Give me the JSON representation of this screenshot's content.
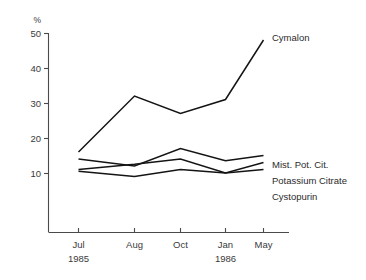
{
  "chart_data": {
    "type": "line",
    "title": "",
    "subtitle": "",
    "xlabel": "",
    "ylabel": "%",
    "ylim": [
      0,
      50
    ],
    "yticks": [
      10,
      20,
      30,
      40,
      50
    ],
    "grid": false,
    "legend_position": "right-inline-labels",
    "categories": [
      "Jul",
      "Aug",
      "Oct",
      "Jan",
      "May"
    ],
    "category_sublabels": [
      "1985",
      "",
      "",
      "1986",
      ""
    ],
    "series": [
      {
        "name": "Cymalon",
        "values": [
          16,
          32,
          27,
          31,
          48
        ]
      },
      {
        "name": "Mist. Pot. Cit.",
        "values": [
          14,
          12,
          17,
          13.5,
          15
        ]
      },
      {
        "name": "Potassium Citrate",
        "values": [
          11,
          12.5,
          14,
          10,
          13
        ]
      },
      {
        "name": "Cystopurin",
        "values": [
          10.5,
          9,
          11,
          10,
          11
        ]
      }
    ],
    "colors": {
      "line": "#141414",
      "axis": "#4a4a4a",
      "text": "#2b2b2b",
      "background": "#ffffff"
    }
  },
  "axis": {
    "unit_symbol": "%",
    "y_tick_labels": [
      "50",
      "40",
      "30",
      "20",
      "10"
    ],
    "x_tick_labels": [
      "Jul",
      "Aug",
      "Oct",
      "Jan",
      "May"
    ],
    "x_year_labels": [
      "1985",
      "1986"
    ]
  },
  "series_labels": {
    "cymalon": "Cymalon",
    "mist_pot_cit": "Mist. Pot. Cit.",
    "potassium_citrate": "Potassium Citrate",
    "cystopurin": "Cystopurin"
  }
}
